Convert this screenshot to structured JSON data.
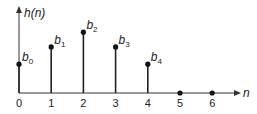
{
  "chart_data": {
    "type": "stem",
    "title": "",
    "ylabel": "h(n)",
    "xlabel": "n",
    "categories": [
      "0",
      "1",
      "2",
      "3",
      "4",
      "5",
      "6"
    ],
    "x": [
      0,
      1,
      2,
      3,
      4,
      5,
      6
    ],
    "values": [
      0.45,
      0.72,
      0.95,
      0.72,
      0.45,
      0,
      0
    ],
    "point_labels": [
      "b",
      "b",
      "b",
      "b",
      "b",
      "",
      ""
    ],
    "point_subscripts": [
      "0",
      "1",
      "2",
      "3",
      "4",
      "",
      ""
    ],
    "grid": false,
    "legend": null
  },
  "axis": {
    "y_label": "h(n)",
    "x_label": "n",
    "ticks": [
      "0",
      "1",
      "2",
      "3",
      "4",
      "5",
      "6"
    ]
  },
  "colors": {
    "stroke": "#222222"
  }
}
